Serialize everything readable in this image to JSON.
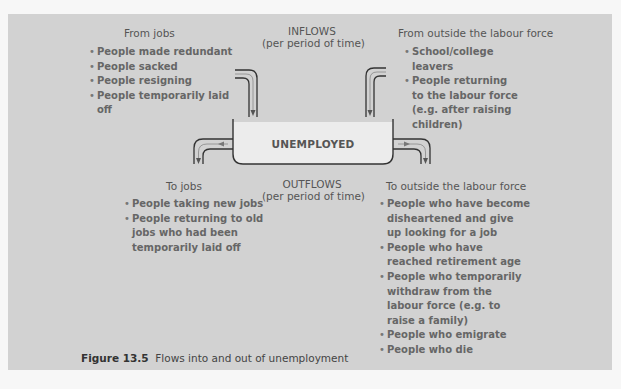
{
  "figure": {
    "number": "Figure 13.5",
    "caption": "Flows into and out of unemployment"
  },
  "inflows": {
    "title": "INFLOWS",
    "subtitle": "(per period of time)"
  },
  "outflows": {
    "title": "OUTFLOWS",
    "subtitle": "(per period of time)"
  },
  "stock": {
    "label": "UNEMPLOYED"
  },
  "from_jobs": {
    "heading": "From jobs",
    "items": [
      "People made redundant",
      "People sacked",
      "People resigning",
      "People temporarily laid off"
    ]
  },
  "from_outside": {
    "heading": "From outside the labour force",
    "items": [
      "School/college leavers",
      "People returning to the labour force (e.g. after raising children)"
    ]
  },
  "to_jobs": {
    "heading": "To jobs",
    "items": [
      "People taking new jobs",
      "People returning to old jobs who had been temporarily laid off"
    ]
  },
  "to_outside": {
    "heading": "To outside the labour force",
    "items": [
      "People who have become disheartened and give up looking for a job",
      "People who have reached retirement age",
      "People who temporarily withdraw from the labour force (e.g. to raise a family)",
      "People who emigrate",
      "People who die"
    ]
  },
  "colors": {
    "panel": "#d2d2d2",
    "page": "#f7f7f7",
    "tank_fill": "#ececec",
    "line": "#333333"
  }
}
